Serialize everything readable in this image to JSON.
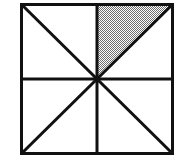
{
  "figure": {
    "shape": "square",
    "background_color": "#ffffff",
    "line_color": "#111111",
    "shade_color": "#8c8c8c",
    "shade_pattern": "stipple-checkerboard",
    "border_width_px": 3,
    "line_width_px": 3,
    "square": {
      "x": 20,
      "y": 3,
      "width": 154,
      "height": 152
    },
    "center_point": {
      "x": 97,
      "y": 79
    },
    "divisions": {
      "total_regions": 8,
      "shaded_regions": 1,
      "fraction_shaded": "1/8",
      "region_type": "right triangle"
    },
    "lines": [
      {
        "name": "vertical-midline",
        "x1": 97,
        "y1": 3,
        "x2": 97,
        "y2": 155
      },
      {
        "name": "horizontal-midline",
        "x1": 20,
        "y1": 79,
        "x2": 174,
        "y2": 79
      },
      {
        "name": "main-diagonal",
        "x1": 20,
        "y1": 3,
        "x2": 174,
        "y2": 155
      },
      {
        "name": "anti-diagonal",
        "x1": 174,
        "y1": 3,
        "x2": 20,
        "y2": 155
      }
    ],
    "shaded_triangle": {
      "name": "upper-left-triangle-of-top-right-quadrant",
      "points": "97,3 174,3 97,79",
      "vertices": [
        {
          "x": 97,
          "y": 3
        },
        {
          "x": 174,
          "y": 3
        },
        {
          "x": 97,
          "y": 79
        }
      ]
    }
  }
}
